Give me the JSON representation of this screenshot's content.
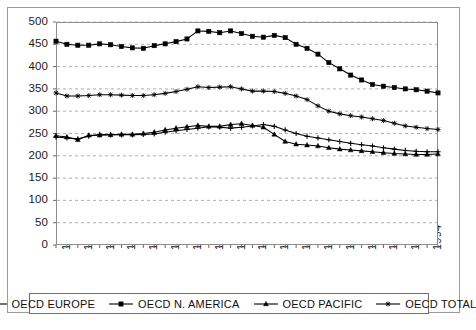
{
  "chart_data": {
    "type": "line",
    "title": "",
    "subtitle": "",
    "xlabel": "",
    "ylabel": "",
    "grid": "horizontal-dashed",
    "legend_position": "bottom",
    "xlim": [
      1960,
      1995
    ],
    "ylim": [
      0,
      500
    ],
    "y_ticks": [
      0,
      50,
      100,
      150,
      200,
      250,
      300,
      350,
      400,
      450,
      500
    ],
    "x_tick_labels": [
      "1960",
      "1962",
      "1964",
      "1966",
      "1968",
      "1970",
      "1972",
      "1974",
      "1976",
      "1978",
      "1980",
      "1982",
      "1984",
      "1986",
      "1988",
      "1990",
      "1992",
      "1994"
    ],
    "x": [
      1960,
      1961,
      1962,
      1963,
      1964,
      1965,
      1966,
      1967,
      1968,
      1969,
      1970,
      1971,
      1972,
      1973,
      1974,
      1975,
      1976,
      1977,
      1978,
      1979,
      1980,
      1981,
      1982,
      1983,
      1984,
      1985,
      1986,
      1987,
      1988,
      1989,
      1990,
      1991,
      1992,
      1993,
      1994,
      1995
    ],
    "series": [
      {
        "name": "OECD EUROPE",
        "marker": "plus",
        "color": "#000000",
        "values": [
          242,
          240,
          238,
          244,
          248,
          247,
          247,
          247,
          248,
          249,
          253,
          256,
          259,
          262,
          265,
          264,
          262,
          264,
          267,
          270,
          266,
          258,
          250,
          244,
          240,
          236,
          232,
          228,
          225,
          222,
          218,
          215,
          212,
          210,
          209,
          209
        ]
      },
      {
        "name": "OECD N. AMERICA",
        "marker": "square",
        "color": "#000000",
        "values": [
          457,
          450,
          448,
          448,
          451,
          449,
          445,
          442,
          441,
          447,
          451,
          456,
          462,
          480,
          479,
          476,
          480,
          474,
          468,
          466,
          470,
          465,
          450,
          441,
          428,
          409,
          395,
          381,
          370,
          360,
          356,
          353,
          350,
          348,
          345,
          341
        ]
      },
      {
        "name": "OECD PACIFIC",
        "marker": "triangle",
        "color": "#000000",
        "values": [
          245,
          242,
          236,
          246,
          246,
          247,
          248,
          248,
          250,
          253,
          258,
          262,
          265,
          268,
          266,
          266,
          270,
          272,
          268,
          264,
          248,
          232,
          226,
          224,
          222,
          218,
          215,
          213,
          211,
          209,
          207,
          205,
          204,
          203,
          203,
          204
        ]
      },
      {
        "name": "OECD TOTAL",
        "marker": "star",
        "color": "#000000",
        "values": [
          341,
          334,
          334,
          335,
          337,
          337,
          336,
          335,
          335,
          337,
          340,
          344,
          349,
          355,
          353,
          354,
          355,
          350,
          345,
          345,
          344,
          340,
          334,
          326,
          312,
          300,
          294,
          290,
          287,
          283,
          279,
          273,
          267,
          264,
          261,
          259
        ]
      }
    ]
  },
  "legend": {
    "items": [
      {
        "label": "OECD EUROPE",
        "marker": "plus"
      },
      {
        "label": "OECD N. AMERICA",
        "marker": "square"
      },
      {
        "label": "OECD PACIFIC",
        "marker": "triangle"
      },
      {
        "label": "OECD TOTAL",
        "marker": "star"
      }
    ]
  }
}
